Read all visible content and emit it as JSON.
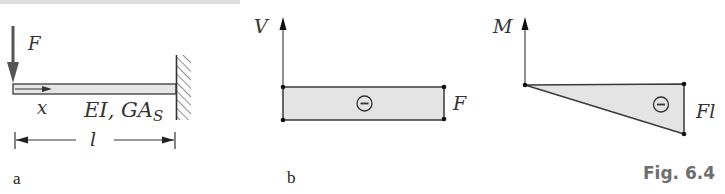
{
  "figure": {
    "caption": "Fig. 6.4",
    "colors": {
      "line": "#3a3a3a",
      "fill": "#e4e4e4",
      "caption": "#6e6e6e"
    },
    "panel_a": {
      "label": "a",
      "force_label": "F",
      "coordinate_label": "x",
      "stiffness_label": "EI, GA",
      "stiffness_subscript": "S",
      "length_label": "l",
      "support": "fixed wall (right end)"
    },
    "panel_b": {
      "label": "b",
      "axis_label": "V",
      "value_label": "F",
      "sign": "⊖"
    },
    "panel_c": {
      "axis_label": "M",
      "value_label": "Fl",
      "sign": "⊖"
    }
  }
}
